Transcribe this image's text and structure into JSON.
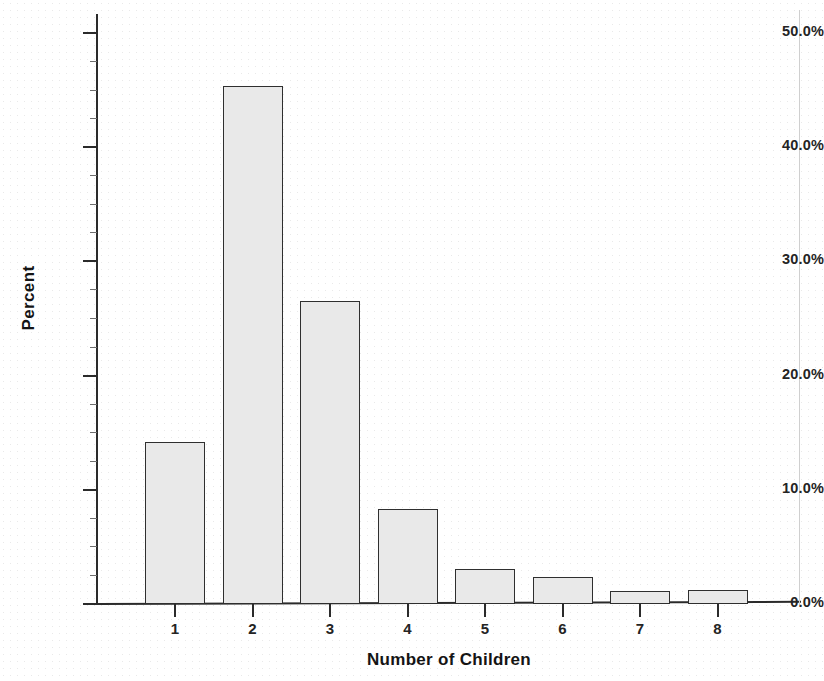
{
  "chart_data": {
    "type": "bar",
    "title": "",
    "xlabel": "Number of Children",
    "ylabel": "Percent",
    "categories": [
      "1",
      "2",
      "3",
      "4",
      "5",
      "6",
      "7",
      "8"
    ],
    "values": [
      14.2,
      45.4,
      26.5,
      8.3,
      3.1,
      2.4,
      1.1,
      1.2
    ],
    "ylim": [
      0,
      50
    ],
    "ytick_values": [
      0,
      10,
      20,
      30,
      40,
      50
    ],
    "ytick_labels": [
      "0.0%",
      "10.0%",
      "20.0%",
      "30.0%",
      "40.0%",
      "50.0%"
    ],
    "yminor_tick_values": [
      2.5,
      5,
      7.5,
      12.5,
      15,
      17.5,
      22.5,
      25,
      27.5,
      32.5,
      35,
      37.5,
      42.5,
      45,
      47.5
    ],
    "grid": false,
    "legend": null,
    "legend_position": "none",
    "bar_fill_color": "#e9e9e9",
    "bar_edge_color": "#2f2f2f",
    "bar_fill_pattern": "stippled-dots",
    "axis_color": "#2b2b2b",
    "background_color": "#ffffff"
  }
}
